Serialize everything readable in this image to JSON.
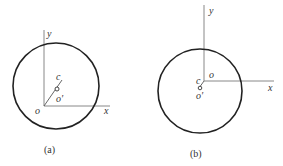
{
  "panels": [
    {
      "caption": "(a)",
      "labels": {
        "y": "y",
        "x": "x",
        "origin": "o",
        "c": "c",
        "o_prime": "o′"
      }
    },
    {
      "caption": "(b)",
      "labels": {
        "y": "y",
        "x": "x",
        "origin": "o",
        "c": "c",
        "o_prime": "o′"
      }
    }
  ],
  "colors": {
    "stroke": "#222222",
    "axis": "#777777",
    "text": "#333333"
  }
}
